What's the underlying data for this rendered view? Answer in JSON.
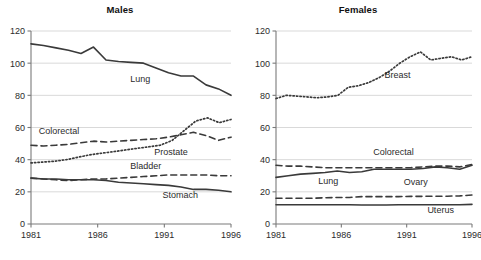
{
  "figure": {
    "width": 481,
    "height": 260,
    "background": "#ffffff",
    "line_color": "#3a3a3a",
    "grid_color": "#d9d9d9",
    "axis_color": "#7a7a7a"
  },
  "chart_data": [
    {
      "type": "line",
      "title": "Males",
      "xlabel": "",
      "ylabel": "",
      "x": [
        1981,
        1982,
        1983,
        1984,
        1985,
        1986,
        1987,
        1988,
        1989,
        1990,
        1991,
        1992,
        1993,
        1994,
        1995,
        1996
      ],
      "xlim": [
        1981,
        1996
      ],
      "ylim": [
        0,
        120
      ],
      "xticks": [
        1981,
        1986,
        1991,
        1996
      ],
      "yticks": [
        0,
        20,
        40,
        60,
        80,
        100,
        120
      ],
      "grid": "horizontal",
      "legend": "inline-annotations",
      "series": [
        {
          "name": "Lung",
          "style": "solid",
          "label_x": 1989.2,
          "label_y": 88,
          "values": [
            112,
            111,
            109.5,
            108,
            106,
            110,
            102,
            101,
            100.5,
            100,
            97,
            94,
            92,
            92,
            86.5,
            84,
            80
          ]
        },
        {
          "name": "Colorectal",
          "style": "dashed",
          "label_x": 1983.1,
          "label_y": 56,
          "values": [
            49,
            48.5,
            49,
            49.5,
            50.5,
            51.5,
            51,
            51.5,
            52,
            52.5,
            53,
            54,
            55.5,
            57,
            55,
            52,
            54
          ]
        },
        {
          "name": "Prostate",
          "style": "dotted",
          "label_x": 1991.5,
          "label_y": 43,
          "values": [
            38,
            38.5,
            39,
            40,
            41.5,
            43,
            44,
            45,
            46,
            47,
            48,
            49,
            52,
            58,
            64,
            66,
            63,
            65
          ]
        },
        {
          "name": "Bladder",
          "style": "dashed",
          "label_x": 1989.6,
          "label_y": 34,
          "values": [
            28.5,
            28,
            27.5,
            27,
            27.5,
            28,
            28,
            28.5,
            29,
            29.5,
            30,
            30.5,
            30.5,
            30.5,
            30.5,
            30,
            30
          ]
        },
        {
          "name": "Stomach",
          "style": "solid",
          "label_x": 1992.2,
          "label_y": 16,
          "values": [
            28.5,
            28,
            28,
            27.5,
            27.5,
            27.5,
            27,
            26,
            25.5,
            25,
            24.5,
            24,
            23,
            21.5,
            21.5,
            21,
            20
          ]
        }
      ]
    },
    {
      "type": "line",
      "title": "Females",
      "xlabel": "",
      "ylabel": "",
      "x": [
        1981,
        1982,
        1983,
        1984,
        1985,
        1986,
        1987,
        1988,
        1989,
        1990,
        1991,
        1992,
        1993,
        1994,
        1995,
        1996
      ],
      "xlim": [
        1981,
        1996
      ],
      "ylim": [
        0,
        120
      ],
      "xticks": [
        1981,
        1986,
        1991,
        1996
      ],
      "yticks": [
        0,
        20,
        40,
        60,
        80,
        100,
        120
      ],
      "grid": "horizontal",
      "legend": "inline-annotations",
      "series": [
        {
          "name": "Breast",
          "style": "dotted",
          "label_x": 1990.3,
          "label_y": 91,
          "values": [
            78,
            80,
            79.5,
            79,
            78.5,
            79,
            80,
            85,
            86,
            88,
            91,
            95,
            100,
            104,
            107,
            102,
            103,
            104,
            102,
            104
          ]
        },
        {
          "name": "Colorectal",
          "style": "dashed",
          "label_x": 1990.0,
          "label_y": 43,
          "values": [
            36.5,
            36,
            36,
            35.5,
            35,
            35,
            35,
            35,
            35,
            35,
            35,
            35,
            35.5,
            36,
            36,
            35.5,
            37
          ]
        },
        {
          "name": "Lung",
          "style": "solid",
          "label_x": 1985.0,
          "label_y": 25,
          "values": [
            29,
            30,
            31,
            31.5,
            32,
            33,
            32,
            32.5,
            34,
            34,
            34,
            34,
            34.5,
            35.5,
            35,
            34,
            36.5
          ]
        },
        {
          "name": "Ovary",
          "style": "dashed",
          "label_x": 1991.7,
          "label_y": 24,
          "values": [
            16,
            16,
            16,
            16,
            16.3,
            16.5,
            16.5,
            17,
            17,
            17,
            17,
            17.2,
            17.2,
            17.3,
            17.3,
            17.5,
            18
          ]
        },
        {
          "name": "Uterus",
          "style": "solid",
          "label_x": 1993.6,
          "label_y": 7,
          "values": [
            12,
            12,
            12,
            12,
            12,
            12,
            12,
            11.8,
            11.8,
            11.8,
            12,
            12,
            12,
            12,
            12,
            12,
            12.2
          ]
        }
      ]
    }
  ]
}
